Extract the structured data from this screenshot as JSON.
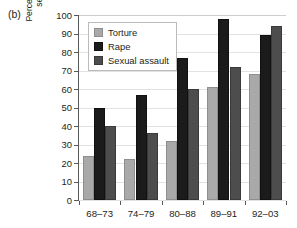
{
  "panel": {
    "label": "(b)"
  },
  "chart_data": {
    "type": "bar",
    "title": "",
    "subtitle": "",
    "xlabel": "",
    "ylabel": "Percent reporting torture/forcible rape/ sexual assault who are Shiites",
    "ylabel_lines": [
      "Percent reporting torture/forcible rape/",
      "sexual assault who are Shiites"
    ],
    "categories": [
      "68–73",
      "74–79",
      "80–88",
      "89–91",
      "92–03"
    ],
    "series": [
      {
        "name": "Torture",
        "color": "#a9a9a9",
        "values": [
          24,
          22,
          32,
          61,
          68
        ]
      },
      {
        "name": "Rape",
        "color": "#1b1b1b",
        "values": [
          50,
          57,
          77,
          98,
          89
        ]
      },
      {
        "name": "Sexual assault",
        "color": "#4d4d4d",
        "values": [
          40,
          36,
          60,
          72,
          94
        ]
      }
    ],
    "ylim": [
      0,
      100
    ],
    "yticks": [
      0,
      10,
      20,
      30,
      40,
      50,
      60,
      70,
      80,
      90,
      100
    ],
    "ytick_labels": [
      "0",
      "10",
      "20",
      "30",
      "40",
      "50",
      "60",
      "70",
      "80",
      "90",
      "100"
    ],
    "grid": true,
    "grid_axis": "y",
    "legend_position": "upper-left",
    "annotations": []
  },
  "legend": {
    "entries": [
      {
        "label": "Torture"
      },
      {
        "label": "Rape"
      },
      {
        "label": "Sexual assault"
      }
    ]
  },
  "colors": {
    "torture": "#a9a9a9",
    "rape": "#1b1b1b",
    "sexual_assault": "#4d4d4d",
    "axis": "#58595b",
    "grid": "#e4e2e0",
    "text": "#231f20",
    "background": "#ffffff"
  }
}
